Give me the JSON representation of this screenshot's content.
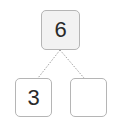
{
  "number_bond": {
    "whole": "6",
    "parts": [
      "3",
      ""
    ]
  },
  "colors": {
    "box_border": "#b5b5b5",
    "top_fill": "#f2f2f2",
    "line": "#a0a0a0"
  }
}
